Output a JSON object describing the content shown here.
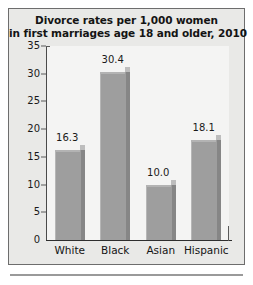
{
  "chart_data": {
    "type": "bar",
    "title": "Divorce rates per 1,000 women in first marriages age 18 and older, 2010",
    "title_lines": [
      "Divorce rates per 1,000 women",
      "in first marriages age 18 and older, 2010"
    ],
    "categories": [
      "White",
      "Black",
      "Asian",
      "Hispanic"
    ],
    "values": [
      16.3,
      30.4,
      10.0,
      18.1
    ],
    "value_labels": [
      "16.3",
      "30.4",
      "10.0",
      "18.1"
    ],
    "xlabel": "",
    "ylabel": "",
    "ylim": [
      0,
      35
    ],
    "yticks": [
      0,
      5,
      10,
      15,
      20,
      25,
      30,
      35
    ],
    "ytick_labels": [
      "0",
      "5",
      "10",
      "15",
      "20",
      "25",
      "30",
      "35"
    ],
    "grid": false,
    "legend": false,
    "style": "3d-column",
    "colors": {
      "bar_front": "#9e9e9e",
      "bar_side": "#868686",
      "bar_top": "#bdbdbd",
      "plot_background": "#f4f4f3",
      "panel_background": "#e9e9e7",
      "panel_border": "#6d6d6d",
      "axis": "#2e2e2e",
      "text": "#141414"
    }
  }
}
